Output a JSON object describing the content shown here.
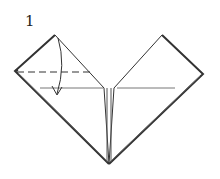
{
  "diagram": {
    "type": "origami-fold-step",
    "step_number": "1",
    "elements": [
      {
        "name": "left-square-flap",
        "shape": "diamond"
      },
      {
        "name": "right-square-flap",
        "shape": "diamond"
      },
      {
        "name": "valley-fold-line",
        "style": "dashed"
      },
      {
        "name": "fold-arrow",
        "direction": "down"
      }
    ],
    "colors": {
      "line": "#333333",
      "background": "#ffffff"
    }
  }
}
